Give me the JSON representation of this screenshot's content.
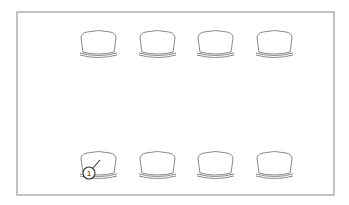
{
  "diagram": {
    "type": "seating-layout-line-drawing",
    "frame": {
      "x": 17,
      "y": 12,
      "width": 317,
      "height": 183,
      "stroke": "#9a9a9a"
    },
    "seat_size": {
      "width": 37,
      "height": 27
    },
    "rows": [
      {
        "name": "top-row",
        "seats": [
          {
            "id": "seat-1-1",
            "x": 80,
            "y": 30
          },
          {
            "id": "seat-1-2",
            "x": 139,
            "y": 30
          },
          {
            "id": "seat-1-3",
            "x": 197,
            "y": 30
          },
          {
            "id": "seat-1-4",
            "x": 256,
            "y": 30
          }
        ]
      },
      {
        "name": "bottom-row",
        "seats": [
          {
            "id": "seat-2-1",
            "x": 80,
            "y": 151
          },
          {
            "id": "seat-2-2",
            "x": 139,
            "y": 151
          },
          {
            "id": "seat-2-3",
            "x": 197,
            "y": 151
          },
          {
            "id": "seat-2-4",
            "x": 256,
            "y": 151
          }
        ]
      }
    ],
    "callouts": [
      {
        "label": "1",
        "cx": 89,
        "cy": 173,
        "r": 6,
        "leader": {
          "x1": 93,
          "y1": 168,
          "x2": 100,
          "y2": 160
        }
      }
    ],
    "line_color": "#8a8a8a"
  }
}
